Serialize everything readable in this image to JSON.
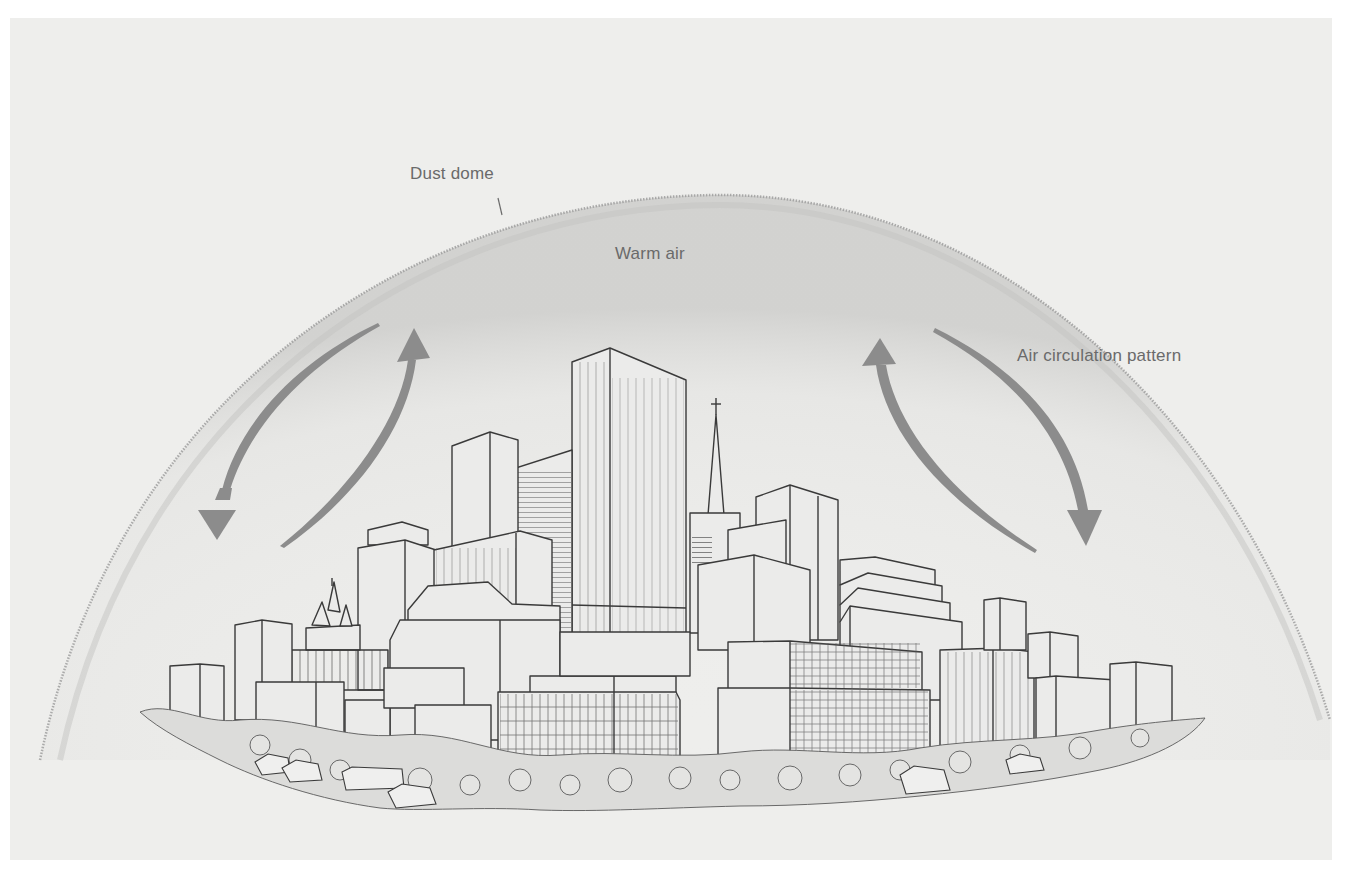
{
  "figure": {
    "labels": {
      "dust_dome": "Dust dome",
      "warm_air": "Warm air",
      "air_circulation": "Air circulation pattern"
    },
    "colors": {
      "background": "#ffffff",
      "panel": "#eeeeec",
      "dome_haze": "#e2e2e0",
      "dome_edge": "#8a8a8a",
      "arrow": "#8c8c8c",
      "ink": "#3a3a3a",
      "building_fill": "#ebebea",
      "label_text": "#6a6a6a"
    },
    "elements": {
      "dome": "dust-dome-arc",
      "arrows": [
        {
          "side": "left",
          "direction": "down",
          "name": "left-downdraft-arrow"
        },
        {
          "side": "left",
          "direction": "up",
          "name": "left-updraft-arrow"
        },
        {
          "side": "right",
          "direction": "up",
          "name": "right-updraft-arrow"
        },
        {
          "side": "right",
          "direction": "down",
          "name": "right-downdraft-arrow"
        }
      ],
      "city": "city-skyline-illustration"
    }
  }
}
